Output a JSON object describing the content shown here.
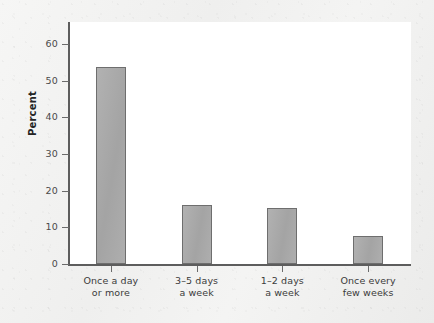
{
  "chart_data": {
    "type": "bar",
    "title": "",
    "xlabel": "",
    "ylabel": "Percent",
    "ylim": [
      0,
      60
    ],
    "grid": false,
    "legend": false,
    "categories": [
      "Once a day or more",
      "3–5 days a week",
      "1–2 days a week",
      "Once every few weeks"
    ],
    "category_lines": [
      [
        "Once a day",
        "or more"
      ],
      [
        "3–5 days",
        "a week"
      ],
      [
        "1–2 days",
        "a week"
      ],
      [
        "Once every",
        "few weeks"
      ]
    ],
    "values": [
      53.8,
      16.0,
      15.3,
      7.6
    ],
    "y_ticks": [
      0,
      10,
      20,
      30,
      40,
      50,
      60
    ],
    "y_tick_labels": [
      "0",
      "10",
      "20",
      "30",
      "40",
      "50",
      "60"
    ],
    "colors": {
      "bar_fill": "#a9a9a9",
      "bar_border": "#6e6e6e",
      "axis": "#5d5d5d",
      "plot_background": "#ffffff",
      "page_background": "#f3f3f2",
      "text": "#3b3b3b"
    }
  }
}
